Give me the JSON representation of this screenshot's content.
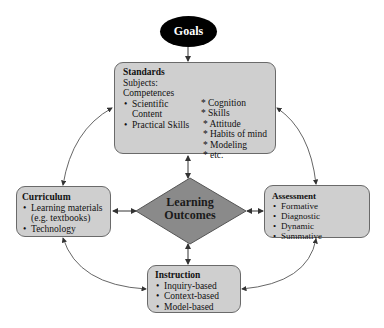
{
  "goals": {
    "label": "Goals"
  },
  "standards": {
    "title": "Standards",
    "lines": [
      "Subjects:",
      "Competences"
    ],
    "bullets": [
      "Scientific Content",
      "Practical Skills"
    ],
    "star_items": [
      "* Cognition",
      "* Skills",
      "* Attitude",
      "* Habits of mind",
      "* Modeling",
      "* etc."
    ]
  },
  "curriculum": {
    "title": "Curriculum",
    "bullets": [
      "Learning materials (e.g. textbooks)",
      "Technology"
    ]
  },
  "assessment": {
    "title": "Assessment",
    "bullets": [
      "Formative",
      "Diagnostic",
      "Dynamic",
      "Summative"
    ]
  },
  "instruction": {
    "title": "Instruction",
    "bullets": [
      "Inquiry-based",
      "Context-based",
      "Model-based"
    ]
  },
  "outcomes": {
    "line1": "Learning",
    "line2": "Outcomes"
  },
  "colors": {
    "box_fill": "#cfcfcf",
    "diamond_fill": "#8a8a8a",
    "goals_fill": "#000000",
    "line": "#555555"
  }
}
